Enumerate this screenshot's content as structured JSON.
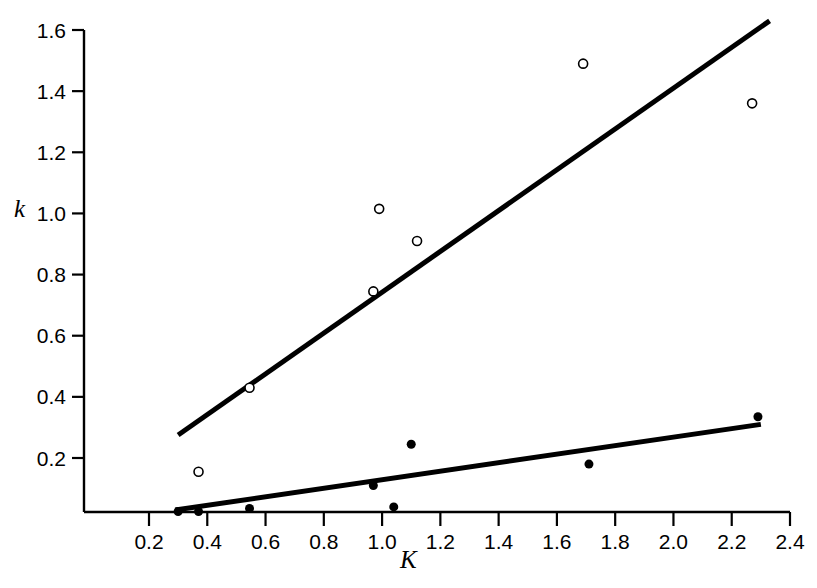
{
  "figure": {
    "top_caption": "",
    "background": "#ffffff",
    "ink_color": "#000000"
  },
  "chart_data": {
    "type": "scatter",
    "title": "",
    "xlabel": "K",
    "ylabel": "k",
    "xlim": [
      0.0,
      2.5
    ],
    "ylim": [
      0.0,
      1.68
    ],
    "xticks": [
      "0.2",
      "0.4",
      "0.6",
      "0.8",
      "1.0",
      "1.2",
      "1.4",
      "1.6",
      "1.8",
      "2.0",
      "2.2",
      "2.4"
    ],
    "xtick_values": [
      0.2,
      0.4,
      0.6,
      0.8,
      1.0,
      1.2,
      1.4,
      1.6,
      1.8,
      2.0,
      2.2,
      2.4
    ],
    "yticks": [
      "0.2",
      "0.4",
      "0.6",
      "0.8",
      "1.0",
      "1.2",
      "1.4",
      "1.6"
    ],
    "ytick_values": [
      0.2,
      0.4,
      0.6,
      0.8,
      1.0,
      1.2,
      1.4,
      1.6
    ],
    "grid": false,
    "legend_position": "none",
    "series": [
      {
        "name": "open-circles",
        "marker": "open-circle",
        "marker_size": 9,
        "color": "#000000",
        "points": [
          {
            "x": 0.37,
            "y": 0.155
          },
          {
            "x": 0.545,
            "y": 0.43
          },
          {
            "x": 0.97,
            "y": 0.745
          },
          {
            "x": 0.99,
            "y": 1.015
          },
          {
            "x": 1.12,
            "y": 0.91
          },
          {
            "x": 1.69,
            "y": 1.49
          },
          {
            "x": 2.27,
            "y": 1.36
          }
        ]
      },
      {
        "name": "filled-circles",
        "marker": "filled-circle",
        "marker_size": 9,
        "color": "#000000",
        "points": [
          {
            "x": 0.3,
            "y": 0.025
          },
          {
            "x": 0.37,
            "y": 0.025
          },
          {
            "x": 0.545,
            "y": 0.035
          },
          {
            "x": 0.97,
            "y": 0.11
          },
          {
            "x": 1.04,
            "y": 0.04
          },
          {
            "x": 1.1,
            "y": 0.245
          },
          {
            "x": 1.71,
            "y": 0.18
          },
          {
            "x": 2.29,
            "y": 0.335
          }
        ]
      }
    ],
    "fit_lines": [
      {
        "name": "upper-fit-line",
        "for_series": "open-circles",
        "x0": 0.3,
        "y0": 0.275,
        "x1": 2.33,
        "y1": 1.63,
        "width": 5,
        "color": "#000000"
      },
      {
        "name": "lower-fit-line",
        "for_series": "filled-circles",
        "x0": 0.29,
        "y0": 0.03,
        "x1": 2.3,
        "y1": 0.31,
        "width": 5,
        "color": "#000000"
      }
    ]
  }
}
